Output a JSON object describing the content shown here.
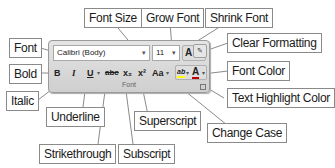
{
  "ribbon_group": {
    "name": "Font",
    "font_name": "Calibri (Body)",
    "font_size": "11",
    "buttons": {
      "bold": "B",
      "italic": "I",
      "underline": "U",
      "strikethrough": "abc",
      "subscript": "x₂",
      "superscript": "x²",
      "change_case": "Aa",
      "grow_font": "A",
      "shrink_font": "A",
      "text_highlight": "ab",
      "font_color": "A"
    }
  },
  "callouts": {
    "font": "Font",
    "font_size": "Font Size",
    "grow_font": "Grow Font",
    "shrink_font": "Shrink Font",
    "clear_formatting": "Clear Formatting",
    "bold": "Bold",
    "italic": "Italic",
    "underline": "Underline",
    "strikethrough": "Strikethrough",
    "subscript": "Subscript",
    "superscript": "Superscript",
    "change_case": "Change Case",
    "font_color": "Font Color",
    "text_highlight_color": "Text Highlight Color"
  },
  "colors": {
    "font_color_bar": "#c00000",
    "highlight_bar": "#ffff00"
  }
}
